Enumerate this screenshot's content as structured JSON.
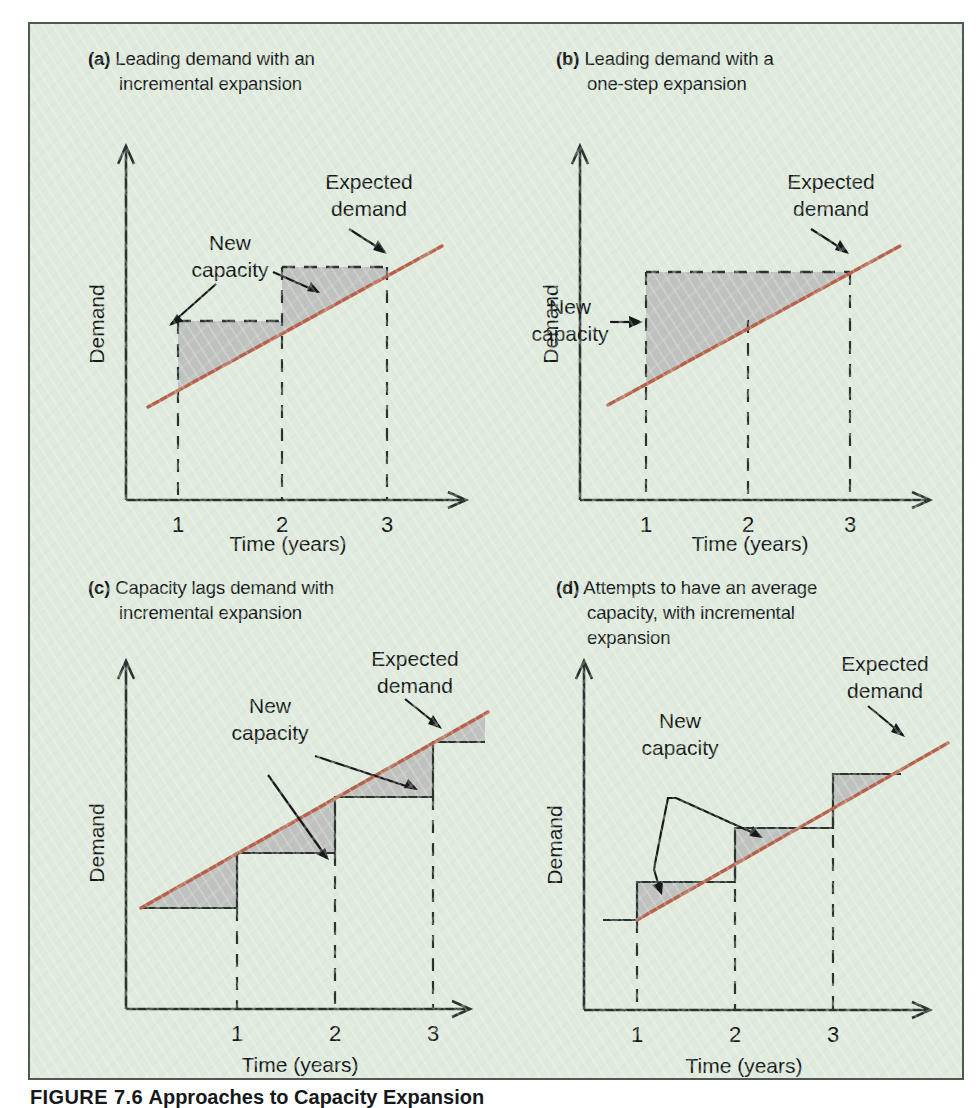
{
  "figure": {
    "caption_number": "FIGURE 7.6",
    "caption_text": "Approaches to Capacity Expansion",
    "background_color": "#e0ebde",
    "border_color": "#4e5a50",
    "demand_line_color": "#b5614c",
    "shade_color": "#b6b7b5"
  },
  "common": {
    "y_axis_label": "Demand",
    "x_axis_label": "Time (years)",
    "x_ticks": [
      "1",
      "2",
      "3"
    ],
    "label_expected_demand_line1": "Expected",
    "label_expected_demand_line2": "demand",
    "label_new_capacity_line1": "New",
    "label_new_capacity_line2": "capacity"
  },
  "panels": [
    {
      "id": "a",
      "tag": "(a)",
      "title_line1": "Leading demand with an",
      "title_line2": "incremental expansion",
      "capacity_style": "dashed",
      "step_count": 2,
      "description": "Capacity steps added ahead of demand; each step top sits above the demand line and is shaded until demand catches up."
    },
    {
      "id": "b",
      "tag": "(b)",
      "title_line1": "Leading demand with a",
      "title_line2": "one-step expansion",
      "capacity_style": "dashed",
      "step_count": 1,
      "description": "A single large capacity step at year 1 held through year 3, with a large shaded excess-capacity region."
    },
    {
      "id": "c",
      "tag": "(c)",
      "title_line1": "Capacity lags demand with",
      "title_line2": "incremental expansion",
      "capacity_style": "solid",
      "step_count": 3,
      "description": "Capacity steps trail the demand line; shaded regions represent unmet demand (shortage) above capacity."
    },
    {
      "id": "d",
      "tag": "(d)",
      "title_line1": "Attempts to have an average",
      "title_line2": "capacity, with incremental",
      "title_line3": "expansion",
      "capacity_style": "solid",
      "step_count": 3,
      "description": "Capacity steps straddle the demand line, alternating small surplus and small shortage."
    }
  ],
  "chart_data": {
    "type": "line",
    "title": "Approaches to Capacity Expansion",
    "xlabel": "Time (years)",
    "ylabel": "Demand",
    "x_ticks": [
      1,
      2,
      3
    ],
    "xlim": [
      0,
      3.7
    ],
    "ylim": [
      0,
      10
    ],
    "grid": false,
    "legend": "none",
    "series": [
      {
        "name": "Expected demand",
        "type": "line",
        "color": "#b5614c",
        "x": [
          0.25,
          3.6
        ],
        "y": [
          2.2,
          7.6
        ]
      },
      {
        "name": "New capacity (a) leading, incremental",
        "panel": "a",
        "type": "step",
        "style": "dashed",
        "steps": [
          {
            "x_start": 1.0,
            "x_end": 2.0,
            "level": 4.55
          },
          {
            "x_start": 2.0,
            "x_end": 3.0,
            "level": 6.15
          }
        ]
      },
      {
        "name": "New capacity (b) leading, one-step",
        "panel": "b",
        "type": "step",
        "style": "dashed",
        "steps": [
          {
            "x_start": 1.0,
            "x_end": 3.0,
            "level": 6.15
          }
        ]
      },
      {
        "name": "New capacity (c) lagging, incremental",
        "panel": "c",
        "type": "step",
        "style": "solid",
        "steps": [
          {
            "x_start": 0.1,
            "x_end": 1.0,
            "level": 2.05
          },
          {
            "x_start": 1.0,
            "x_end": 2.0,
            "level": 3.6
          },
          {
            "x_start": 2.0,
            "x_end": 3.0,
            "level": 5.2
          },
          {
            "x_start": 3.0,
            "x_end": 3.6,
            "level": 6.8
          }
        ]
      },
      {
        "name": "New capacity (d) average, incremental",
        "panel": "d",
        "type": "step",
        "style": "solid",
        "steps": [
          {
            "x_start": 0.1,
            "x_end": 1.0,
            "level": 2.5
          },
          {
            "x_start": 1.0,
            "x_end": 2.0,
            "level": 4.1
          },
          {
            "x_start": 2.0,
            "x_end": 3.0,
            "level": 5.7
          },
          {
            "x_start": 3.0,
            "x_end": 3.6,
            "level": 7.3
          }
        ]
      }
    ],
    "annotations": [
      {
        "text": "Expected demand",
        "panels": [
          "a",
          "b",
          "c",
          "d"
        ],
        "arrow": true
      },
      {
        "text": "New capacity",
        "panels": [
          "a",
          "b",
          "c",
          "d"
        ],
        "arrow": true
      }
    ]
  }
}
